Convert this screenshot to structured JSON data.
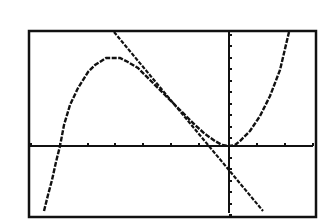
{
  "chart_data": {
    "type": "line",
    "title": "",
    "xlabel": "",
    "ylabel": "",
    "window": {
      "frame_px": {
        "left": 29,
        "top": 31,
        "right": 316,
        "bottom": 217
      },
      "origin_px": {
        "x": 229,
        "y": 146
      },
      "x_tick_spacing_px": 28,
      "y_tick_spacing_px": 11.5,
      "x_ticks_px": [
        31,
        60,
        88,
        115,
        143,
        171,
        199,
        229,
        257,
        285,
        313
      ],
      "y_ticks_px": [
        35,
        46,
        58,
        69,
        81,
        92,
        104,
        115,
        127,
        138,
        146,
        158,
        169,
        181,
        192,
        204,
        215
      ],
      "grid": false,
      "axes": true,
      "approx_xlim": [
        -7,
        3
      ],
      "approx_ylim": [
        -6,
        10
      ]
    },
    "series": [
      {
        "name": "cubic",
        "kind": "curve",
        "points_px": [
          [
            44,
            211
          ],
          [
            48,
            195
          ],
          [
            52,
            180
          ],
          [
            56,
            162
          ],
          [
            60,
            146
          ],
          [
            64,
            125
          ],
          [
            70,
            105
          ],
          [
            78,
            88
          ],
          [
            88,
            72
          ],
          [
            95,
            65
          ],
          [
            106,
            58
          ],
          [
            120,
            58
          ],
          [
            128,
            62
          ],
          [
            138,
            68
          ],
          [
            150,
            80
          ],
          [
            165,
            95
          ],
          [
            180,
            110
          ],
          [
            195,
            125
          ],
          [
            205,
            134
          ],
          [
            215,
            141
          ],
          [
            222,
            145
          ],
          [
            229,
            146
          ],
          [
            235,
            145
          ],
          [
            240,
            141
          ],
          [
            250,
            131
          ],
          [
            260,
            116
          ],
          [
            270,
            96
          ],
          [
            280,
            70
          ],
          [
            289,
            32
          ]
        ]
      },
      {
        "name": "tangent-line",
        "kind": "line",
        "points_px": [
          [
            114,
            32
          ],
          [
            263,
            211
          ]
        ]
      }
    ],
    "legend": []
  },
  "style": {
    "background": "#ffffff",
    "ink": "#111111"
  }
}
